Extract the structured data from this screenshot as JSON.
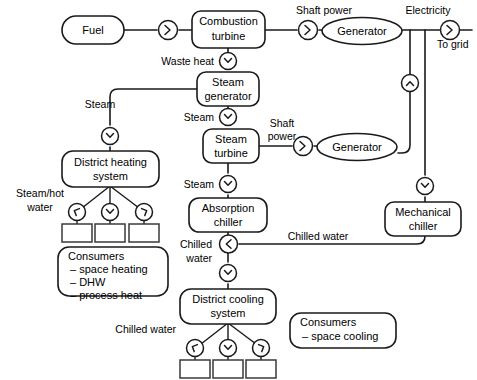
{
  "diagram": {
    "background_color": "#ffffff",
    "line_color": "#1a1a1a",
    "nodes": {
      "fuel": {
        "label": "Fuel",
        "shape": "rounded-rect"
      },
      "combustion_turbine": {
        "label_line1": "Combustion",
        "label_line2": "turbine",
        "shape": "rounded-rect"
      },
      "generator_top": {
        "label": "Generator",
        "shape": "ellipse"
      },
      "steam_generator": {
        "label_line1": "Steam",
        "label_line2": "generator",
        "shape": "rounded-rect"
      },
      "steam_turbine": {
        "label_line1": "Steam",
        "label_line2": "turbine",
        "shape": "rounded-rect"
      },
      "generator_bottom": {
        "label": "Generator",
        "shape": "ellipse"
      },
      "mechanical_chiller": {
        "label_line1": "Mechanical",
        "label_line2": "chiller",
        "shape": "rounded-rect"
      },
      "district_heating": {
        "label_line1": "District heating",
        "label_line2": "system",
        "shape": "rounded-rect"
      },
      "absorption_chiller": {
        "label_line1": "Absorption",
        "label_line2": "chiller",
        "shape": "rounded-rect"
      },
      "district_cooling": {
        "label_line1": "District cooling",
        "label_line2": "system",
        "shape": "rounded-rect"
      },
      "consumers_heat": {
        "title": "Consumers",
        "items": [
          "– space heating",
          "– DHW",
          "– process heat"
        ],
        "shape": "rounded-rect"
      },
      "consumers_cool": {
        "title": "Consumers",
        "items": [
          "– space cooling"
        ],
        "shape": "rounded-rect"
      }
    },
    "edge_labels": {
      "shaft_power_top": "Shaft power",
      "electricity": "Electricity",
      "to_grid": "To grid",
      "waste_heat": "Waste heat",
      "steam_to_district": "Steam",
      "steam_to_turbine": "Steam",
      "shaft_power_bottom_line1": "Shaft",
      "shaft_power_bottom_line2": "power",
      "steam_to_absorption": "Steam",
      "steam_hot_water_line1": "Steam/hot",
      "steam_hot_water_line2": "water",
      "chilled_water_vertical_line1": "Chilled",
      "chilled_water_vertical_line2": "water",
      "chilled_water_horizontal": "Chilled water",
      "chilled_water_consumers": "Chilled water"
    },
    "markers": [
      {
        "name": "fuel-to-turbine-arrow",
        "direction": "right"
      },
      {
        "name": "turbine-to-generator-arrow",
        "direction": "right"
      },
      {
        "name": "to-grid-arrow",
        "direction": "right"
      },
      {
        "name": "waste-heat-arrow",
        "direction": "down"
      },
      {
        "name": "steam-to-district-heating-arrow",
        "direction": "down"
      },
      {
        "name": "steam-to-steam-turbine-arrow",
        "direction": "down"
      },
      {
        "name": "steam-turbine-to-generator-arrow",
        "direction": "right"
      },
      {
        "name": "generator-bottom-electricity-arrow",
        "direction": "up"
      },
      {
        "name": "electricity-to-mechanical-chiller-arrow",
        "direction": "down"
      },
      {
        "name": "steam-to-absorption-chiller-arrow",
        "direction": "down"
      },
      {
        "name": "mechanical-chiller-chilled-water-arrow",
        "direction": "left"
      },
      {
        "name": "chilled-water-to-district-cooling-arrow",
        "direction": "down"
      },
      {
        "name": "district-heating-branch-left-arrow",
        "direction": "down-left"
      },
      {
        "name": "district-heating-branch-center-arrow",
        "direction": "down"
      },
      {
        "name": "district-heating-branch-right-arrow",
        "direction": "down-right"
      },
      {
        "name": "district-cooling-branch-left-arrow",
        "direction": "down-left"
      },
      {
        "name": "district-cooling-branch-center-arrow",
        "direction": "down"
      },
      {
        "name": "district-cooling-branch-right-arrow",
        "direction": "down-right"
      }
    ],
    "terminal_boxes": {
      "heating_count": 3,
      "cooling_count": 3
    }
  }
}
